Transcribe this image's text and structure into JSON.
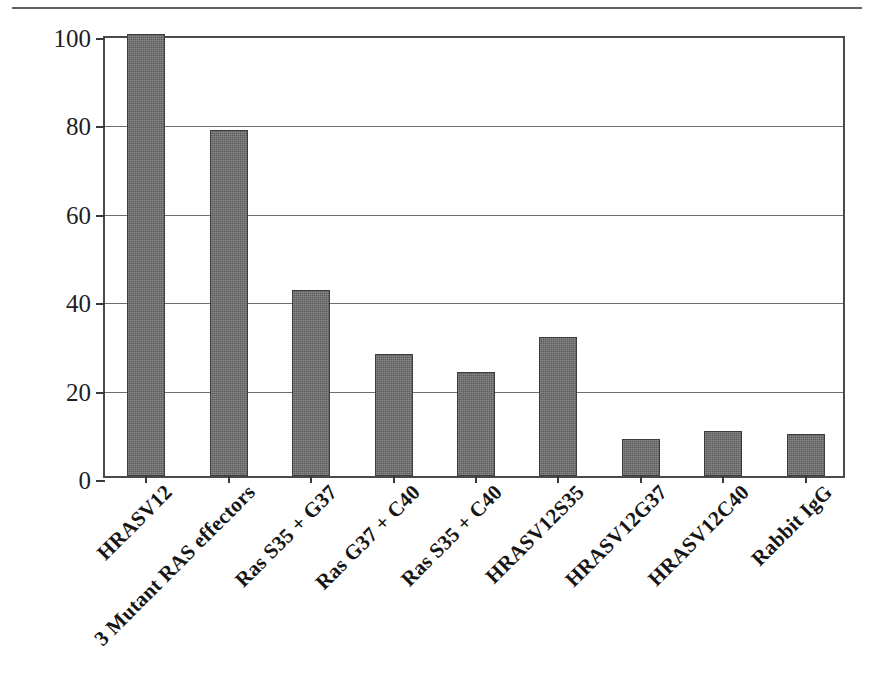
{
  "figure": {
    "top_rule": "horizontal-rule"
  },
  "chart_data": {
    "type": "bar",
    "title": "",
    "xlabel": "",
    "ylabel": "BrdU labelling index (%)",
    "ylim": [
      0,
      100
    ],
    "yticks": [
      0,
      20,
      40,
      60,
      80,
      100
    ],
    "ytick_labels": [
      "0",
      "20",
      "40",
      "60",
      "80",
      "100"
    ],
    "grid": true,
    "legend": null,
    "bar_color": "#5c5c5c",
    "categories": [
      "HRASV12",
      "3 Mutant RAS effectors",
      "Ras S35 + G37",
      "Ras G37 + C40",
      "Ras S35 + C40",
      "HRASV12S35",
      "HRASV12G37",
      "HRASV12C40",
      "Rabbit IgG"
    ],
    "values": [
      100,
      78.3,
      42,
      27.5,
      23.5,
      31.5,
      8.3,
      10.2,
      9.5
    ]
  }
}
